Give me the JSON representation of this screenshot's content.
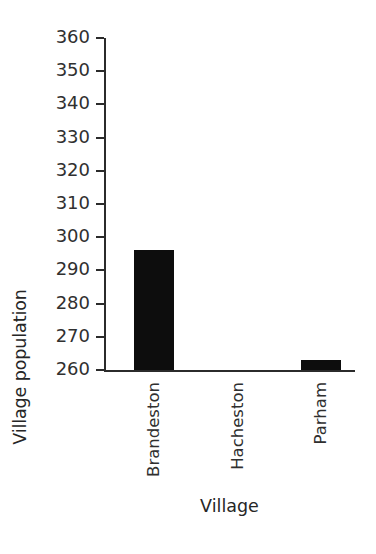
{
  "chart_data": {
    "type": "bar",
    "title": "",
    "subtitle": "",
    "xlabel": "Village",
    "ylabel": "Village population",
    "categories": [
      "Brandeston",
      "Hacheston",
      "Parham"
    ],
    "values": [
      296,
      260,
      263
    ],
    "series": [
      {
        "name": "Village population",
        "values": [
          296,
          260,
          263
        ]
      }
    ],
    "ylim": [
      260,
      360
    ],
    "ytick_labels": [
      "260",
      "270",
      "280",
      "290",
      "300",
      "310",
      "320",
      "330",
      "340",
      "350",
      "360"
    ],
    "ytick_values": [
      260,
      270,
      280,
      290,
      300,
      310,
      320,
      330,
      340,
      350,
      360
    ],
    "grid": false,
    "legend": false,
    "legend_position": "none",
    "bar_color": "#0d0d0d",
    "axis_color": "#2b2b2b",
    "background": "#ffffff",
    "annotations": []
  }
}
